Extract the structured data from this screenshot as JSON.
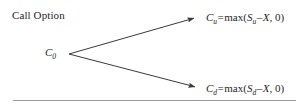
{
  "figure": {
    "caption": "Call Option",
    "width": 307,
    "height": 111,
    "background_color": "#ffffff",
    "text_color": "#262626",
    "line_color": "#3a3a3a",
    "rule_color": "#9a9a9a"
  },
  "root_node": {
    "symbol": "C",
    "subscript": "0",
    "label": "C0"
  },
  "branches": [
    {
      "direction": "up",
      "name": "up-branch",
      "from": [
        69,
        54
      ],
      "to": [
        196,
        17
      ],
      "payoff": {
        "lhs_symbol": "C",
        "lhs_subscript": "u",
        "equals": "=",
        "function": "max",
        "open_paren": "(",
        "arg_symbol": "S",
        "arg_subscript": "u",
        "minus": "–",
        "strike": "X",
        "comma": ",",
        "zero": "0",
        "close_paren": ")",
        "full_text": "Cu = max(Su – X, 0)"
      }
    },
    {
      "direction": "down",
      "name": "down-branch",
      "from": [
        69,
        54
      ],
      "to": [
        197,
        88
      ],
      "payoff": {
        "lhs_symbol": "C",
        "lhs_subscript": "d",
        "equals": "=",
        "function": "max",
        "open_paren": "(",
        "arg_symbol": "S",
        "arg_subscript": "d",
        "minus": "–",
        "strike": "X",
        "comma": ",",
        "zero": "0",
        "close_paren": ")",
        "full_text": "Cd = max(Sd – X, 0)"
      }
    }
  ],
  "divider": {
    "name": "bottom-rule",
    "x_start": 13,
    "x_end": 296,
    "y": 100
  }
}
